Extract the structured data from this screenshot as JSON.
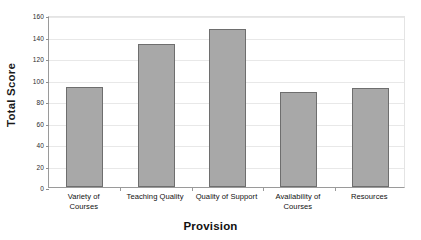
{
  "chart_data": {
    "type": "bar",
    "title": "",
    "xlabel": "Provision",
    "ylabel": "Total Score",
    "categories": [
      "Variety of Courses",
      "Teaching Quality",
      "Quality of Support",
      "Availability of Courses",
      "Resources"
    ],
    "category_lines": [
      [
        "Variety of",
        "Courses"
      ],
      [
        "Teaching Quality"
      ],
      [
        "Quality of Support"
      ],
      [
        "Availability of",
        "Courses"
      ],
      [
        "Resources"
      ]
    ],
    "values": [
      93,
      133,
      147,
      88,
      92
    ],
    "ylim": [
      0,
      160
    ],
    "ytick_labels": [
      "0",
      "20",
      "40",
      "60",
      "80",
      "100",
      "120",
      "140",
      "160"
    ],
    "ytick_values": [
      0,
      20,
      40,
      60,
      80,
      100,
      120,
      140,
      160
    ],
    "grid": true,
    "legend": "none",
    "colors": {
      "bar_fill": "#a8a8a8",
      "bar_border": "#6e6e6e",
      "gridline": "#e8e8e8",
      "axis": "#9a9a9a",
      "background": "#ffffff",
      "text": "#111111"
    }
  }
}
